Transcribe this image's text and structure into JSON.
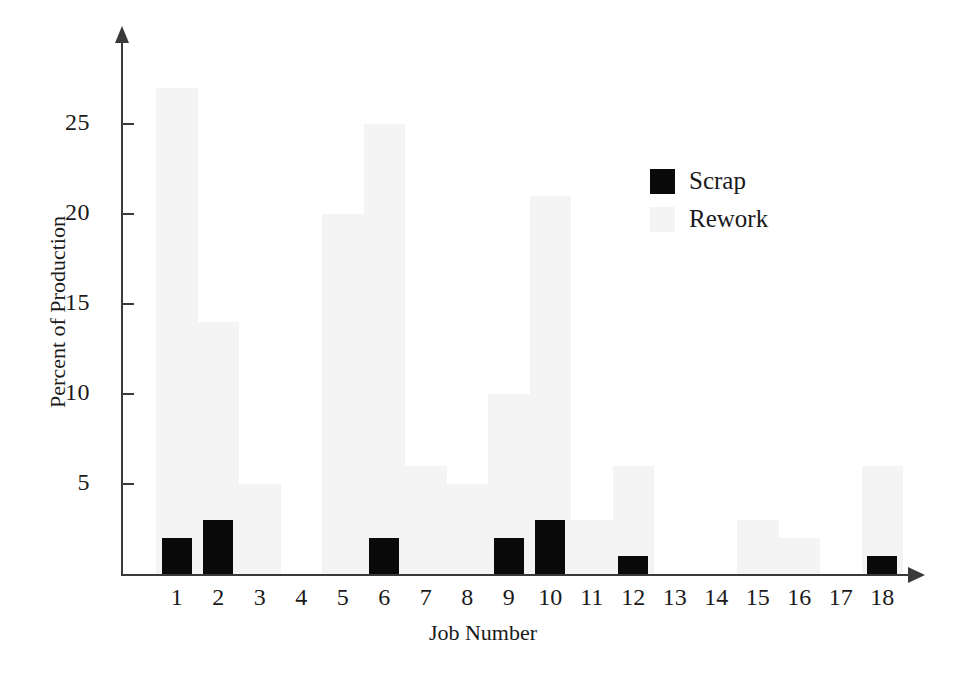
{
  "chart_data": {
    "type": "bar",
    "title": "",
    "xlabel": "Job Number",
    "ylabel": "Percent of Production",
    "categories": [
      "1",
      "2",
      "3",
      "4",
      "5",
      "6",
      "7",
      "8",
      "9",
      "10",
      "11",
      "12",
      "13",
      "14",
      "15",
      "16",
      "17",
      "18"
    ],
    "series": [
      {
        "name": "Scrap",
        "color": "#0a0a0a",
        "values": [
          2,
          3,
          0,
          0,
          0,
          2,
          0,
          0,
          2,
          3,
          0,
          1,
          0,
          0,
          0,
          0,
          0,
          1
        ]
      },
      {
        "name": "Rework",
        "color": "#f4f4f4",
        "values": [
          27,
          14,
          5,
          0,
          20,
          25,
          6,
          5,
          10,
          21,
          3,
          6,
          0,
          0,
          3,
          2,
          0,
          6
        ]
      }
    ],
    "ylim": [
      0,
      28
    ],
    "yticks": [
      5,
      10,
      15,
      20,
      25
    ],
    "ytick_labels": [
      "5",
      "10",
      "15",
      "20",
      "25"
    ],
    "grid": false,
    "legend_position": "upper-right",
    "legend_entries": [
      {
        "label": "Scrap",
        "swatch": "scrap"
      },
      {
        "label": "Rework",
        "swatch": "rework"
      }
    ]
  },
  "axes": {
    "y_title": "Percent of Production",
    "x_title": "Job Number"
  }
}
